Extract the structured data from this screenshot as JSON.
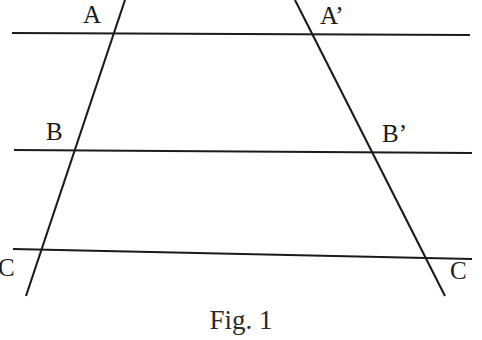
{
  "figure": {
    "caption": "Fig. 1",
    "background_color": "#ffffff",
    "stroke_color": "#1b1b1b",
    "label_color": "#1b1b1b"
  },
  "labels": {
    "a": "A",
    "a_prime": "A’",
    "b": "B",
    "b_prime": "B’",
    "c": "C",
    "c_prime": "C"
  },
  "geometry": {
    "parallel_lines": [
      {
        "name": "line-through-A",
        "x1": 12,
        "y1": 33,
        "x2": 470,
        "y2": 35
      },
      {
        "name": "line-through-B",
        "x1": 14,
        "y1": 150,
        "x2": 472,
        "y2": 153
      },
      {
        "name": "line-through-C",
        "x1": 13,
        "y1": 249,
        "x2": 472,
        "y2": 259
      }
    ],
    "transversals": [
      {
        "name": "left-transversal",
        "x1": 125,
        "y1": 0,
        "x2": 26,
        "y2": 296
      },
      {
        "name": "right-transversal",
        "x1": 295,
        "y1": 0,
        "x2": 445,
        "y2": 296
      }
    ],
    "intersections": [
      {
        "label": "A",
        "x": 111,
        "y": 34
      },
      {
        "label": "A’",
        "x": 313,
        "y": 36
      },
      {
        "label": "B",
        "x": 72,
        "y": 151
      },
      {
        "label": "B’",
        "x": 373,
        "y": 153
      },
      {
        "label": "C",
        "x": 39,
        "y": 250
      },
      {
        "label": "C",
        "x": 424,
        "y": 257
      }
    ]
  }
}
